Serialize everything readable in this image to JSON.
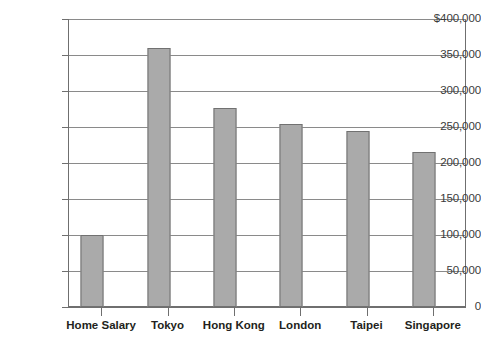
{
  "chart_data": {
    "type": "bar",
    "title": "",
    "xlabel": "",
    "ylabel": "",
    "categories": [
      "Home Salary",
      "Tokyo",
      "Hong Kong",
      "London",
      "Taipei",
      "Singapore"
    ],
    "values": [
      100000,
      360000,
      277000,
      254000,
      244000,
      215000
    ],
    "ylim": [
      0,
      400000
    ],
    "ytick_values": [
      0,
      50000,
      100000,
      150000,
      200000,
      250000,
      300000,
      350000,
      400000
    ],
    "ytick_labels": [
      "0",
      "50,000",
      "100,000",
      "150,000",
      "200,000",
      "250,000",
      "300,000",
      "350,000",
      "$400,000"
    ],
    "grid": true,
    "legend": null,
    "series": [
      {
        "name": "Salary",
        "values": [
          100000,
          360000,
          277000,
          254000,
          244000,
          215000
        ]
      }
    ],
    "colors": {
      "bar_fill": "#aaaaaa",
      "bar_border": "#717171",
      "gridline": "#8a8a8a",
      "axis": "#6f6f6f",
      "label_text": "#231f20",
      "tick_text": "#3a3a3a",
      "background": "#ffffff"
    }
  }
}
